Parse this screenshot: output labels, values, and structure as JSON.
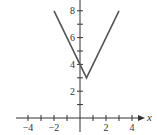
{
  "chart_data": {
    "type": "line",
    "title": "",
    "xlabel": "x",
    "ylabel": "",
    "xlim": [
      -4.8,
      5.2
    ],
    "ylim": [
      0,
      8.8
    ],
    "grid": false,
    "legend": null,
    "x_ticks": [
      -4,
      -3,
      -2,
      -1,
      1,
      2,
      3,
      4
    ],
    "x_tick_labels": [
      "-4",
      "-2",
      "2",
      "4"
    ],
    "x_tick_label_values": [
      -4,
      -2,
      2,
      4
    ],
    "y_ticks": [
      1,
      2,
      3,
      4,
      5,
      6,
      7,
      8
    ],
    "y_tick_labels": [
      "2",
      "4",
      "6",
      "8"
    ],
    "y_tick_label_values": [
      2,
      4,
      6,
      8
    ],
    "function": "y = 2|x - 0.5| + 3",
    "series": [
      {
        "name": "V-shaped absolute value graph",
        "x": [
          -2,
          0.5,
          3
        ],
        "y": [
          8,
          3,
          8
        ]
      }
    ],
    "colors": {
      "line": "#555555",
      "axis": "#333333"
    }
  }
}
